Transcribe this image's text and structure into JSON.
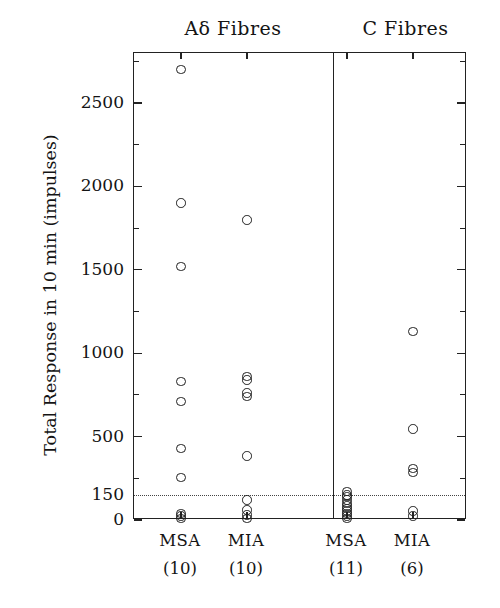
{
  "chart_data": {
    "type": "scatter",
    "title": "",
    "xlabel": "",
    "ylabel": "Total Response in 10 min (impulses)",
    "ylim": [
      0,
      2800
    ],
    "yticks_major": [
      0,
      150,
      500,
      1000,
      1500,
      2000,
      2500
    ],
    "yticks_major_labels": [
      "0",
      "150",
      "500",
      "1000",
      "1500",
      "2000",
      "2500"
    ],
    "yticks_minor": [
      250,
      750,
      1250,
      1750,
      2250,
      2750
    ],
    "grid": false,
    "legend": "none",
    "reference_line": {
      "value": 150,
      "style": "dotted",
      "label": "150"
    },
    "panels": [
      {
        "name": "Aδ Fibres",
        "groups": [
          {
            "name": "MSA",
            "count": "(10)",
            "n": 10,
            "values": [
              2700,
              1900,
              1520,
              830,
              710,
              430,
              255,
              40,
              25,
              10
            ]
          },
          {
            "name": "MIA",
            "count": "(10)",
            "n": 10,
            "values": [
              1800,
              860,
              840,
              760,
              740,
              385,
              120,
              60,
              30,
              10
            ]
          }
        ]
      },
      {
        "name": "C Fibres",
        "groups": [
          {
            "name": "MSA",
            "count": "(11)",
            "n": 11,
            "values": [
              170,
              150,
              140,
              120,
              100,
              85,
              70,
              55,
              40,
              25,
              10
            ]
          },
          {
            "name": "MIA",
            "count": "(6)",
            "n": 6,
            "values": [
              1130,
              545,
              310,
              285,
              55,
              25
            ]
          }
        ]
      }
    ]
  },
  "panel_titles": {
    "adelta": "Aδ Fibres",
    "c": "C Fibres"
  },
  "axis": {
    "y_title": "Total Response in 10 min (impulses)"
  },
  "colors": {
    "marker_stroke": "#1f1f1f",
    "frame": "#222222",
    "reference_line": "#444444",
    "background": "#ffffff"
  }
}
